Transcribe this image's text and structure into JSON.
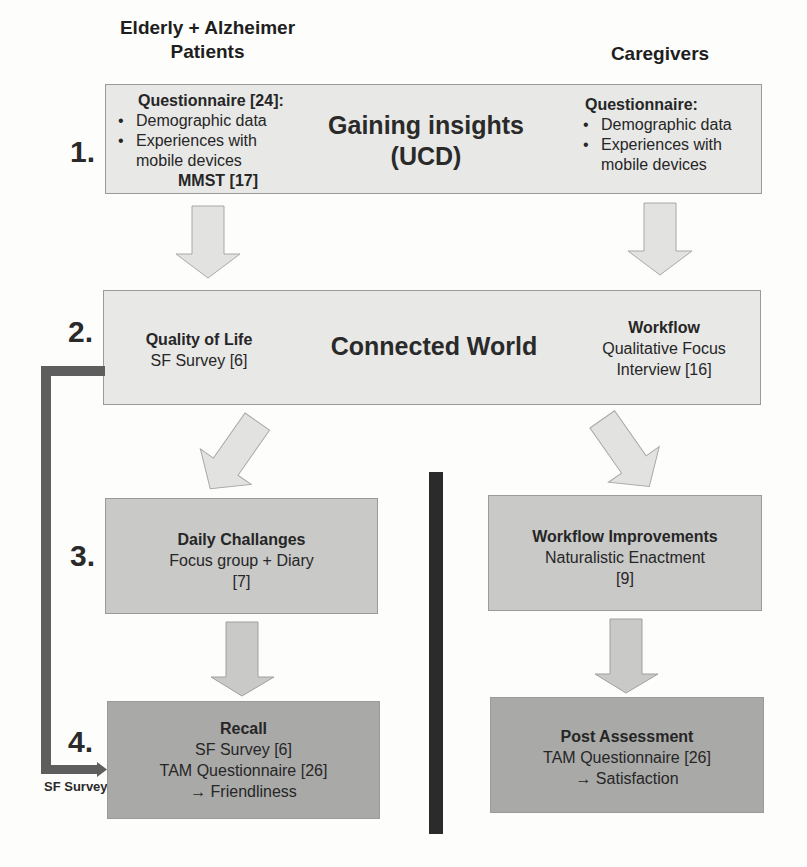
{
  "columns": {
    "left_header": "Elderly + Alzheimer Patients",
    "left_header_lines": [
      "Elderly + Alzheimer",
      "Patients"
    ],
    "right_header": "Caregivers"
  },
  "steps": [
    {
      "number": "1.",
      "center_title_lines": [
        "Gaining insights",
        "(UCD)"
      ],
      "left": {
        "heading": "Questionnaire [24]:",
        "bullets": [
          "Demographic data",
          "Experiences with mobile devices"
        ],
        "bullet_lines": [
          "Experiences with",
          "mobile devices"
        ],
        "footer": "MMST [17]"
      },
      "right": {
        "heading": "Questionnaire:",
        "bullets": [
          "Demographic data",
          "Experiences with mobile devices"
        ],
        "bullet_lines": [
          "Experiences with",
          "mobile devices"
        ]
      },
      "shade": "light"
    },
    {
      "number": "2.",
      "center_title": "Connected World",
      "left": {
        "heading": "Quality of Life",
        "lines": [
          "SF Survey [6]"
        ]
      },
      "right": {
        "heading": "Workflow",
        "lines": [
          "Qualitative Focus",
          "Interview [16]"
        ]
      },
      "shade": "light"
    },
    {
      "number": "3.",
      "left": {
        "heading": "Daily Challanges",
        "lines": [
          "Focus group + Diary",
          "[7]"
        ]
      },
      "right": {
        "heading": "Workflow Improvements",
        "lines": [
          "Naturalistic Enactment",
          "[9]"
        ]
      },
      "shade": "mid"
    },
    {
      "number": "4.",
      "left": {
        "heading": "Recall",
        "lines": [
          "SF Survey [6]",
          "TAM Questionnaire [26]",
          "→ Friendliness"
        ]
      },
      "right": {
        "heading": "Post Assessment",
        "lines": [
          "TAM Questionnaire [26]",
          "→ Satisfaction"
        ]
      },
      "shade": "dark"
    }
  ],
  "connector": {
    "label": "SF Survey",
    "from": "step 2",
    "to": "step 4"
  },
  "colors": {
    "box_light": "#e8e8e6",
    "box_mid": "#c9c9c8",
    "box_dark": "#a9a9a8",
    "arrow_fill": "#e2e2e0",
    "connector": "#5e5e5e",
    "divider": "#2b2b2b"
  }
}
